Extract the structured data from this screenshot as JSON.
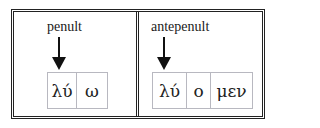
{
  "panels": [
    {
      "label": "penult",
      "arrow_icon": "down-arrow-icon",
      "syllables": [
        "λύ",
        "ω"
      ]
    },
    {
      "label": "antepenult",
      "arrow_icon": "down-arrow-icon",
      "syllables": [
        "λύ",
        "ο",
        "μεν"
      ]
    }
  ],
  "colors": {
    "frame": "#222222",
    "box_border": "#b8b8c0",
    "arrow": "#111111",
    "background": "#ffffff"
  }
}
